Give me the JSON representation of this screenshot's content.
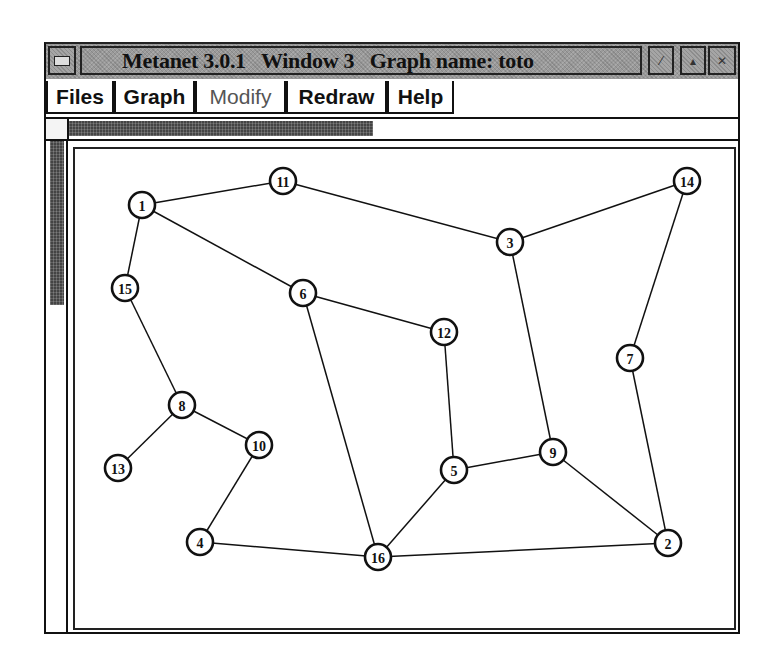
{
  "window": {
    "title": "Metanet 3.0.1   Window 3   Graph name: toto",
    "title_buttons": [
      {
        "name": "system-menu-icon",
        "glyph": ""
      },
      {
        "name": "minimize-icon",
        "glyph": "⁄"
      },
      {
        "name": "maximize-icon",
        "glyph": "▴"
      },
      {
        "name": "close-icon",
        "glyph": "✕"
      }
    ]
  },
  "menu": {
    "items": [
      {
        "label": "Files",
        "enabled": true
      },
      {
        "label": "Graph",
        "enabled": true
      },
      {
        "label": "Modify",
        "enabled": false
      },
      {
        "label": "Redraw",
        "enabled": true
      },
      {
        "label": "Help",
        "enabled": true
      }
    ]
  },
  "graph": {
    "name": "toto",
    "nodes": [
      {
        "id": "1",
        "x": 142,
        "y": 205
      },
      {
        "id": "2",
        "x": 668,
        "y": 543
      },
      {
        "id": "3",
        "x": 510,
        "y": 242
      },
      {
        "id": "4",
        "x": 200,
        "y": 542
      },
      {
        "id": "5",
        "x": 454,
        "y": 470
      },
      {
        "id": "6",
        "x": 303,
        "y": 293
      },
      {
        "id": "7",
        "x": 630,
        "y": 358
      },
      {
        "id": "8",
        "x": 182,
        "y": 405
      },
      {
        "id": "9",
        "x": 553,
        "y": 452
      },
      {
        "id": "10",
        "x": 259,
        "y": 445
      },
      {
        "id": "11",
        "x": 283,
        "y": 181
      },
      {
        "id": "12",
        "x": 444,
        "y": 332
      },
      {
        "id": "13",
        "x": 118,
        "y": 468
      },
      {
        "id": "14",
        "x": 687,
        "y": 181
      },
      {
        "id": "15",
        "x": 125,
        "y": 288
      },
      {
        "id": "16",
        "x": 378,
        "y": 557
      }
    ],
    "edges": [
      [
        "1",
        "11"
      ],
      [
        "11",
        "3"
      ],
      [
        "3",
        "14"
      ],
      [
        "1",
        "15"
      ],
      [
        "1",
        "6"
      ],
      [
        "6",
        "12"
      ],
      [
        "6",
        "16"
      ],
      [
        "15",
        "8"
      ],
      [
        "8",
        "13"
      ],
      [
        "8",
        "10"
      ],
      [
        "10",
        "4"
      ],
      [
        "4",
        "16"
      ],
      [
        "16",
        "5"
      ],
      [
        "16",
        "2"
      ],
      [
        "12",
        "5"
      ],
      [
        "5",
        "9"
      ],
      [
        "3",
        "9"
      ],
      [
        "9",
        "2"
      ],
      [
        "14",
        "7"
      ],
      [
        "7",
        "2"
      ]
    ]
  }
}
